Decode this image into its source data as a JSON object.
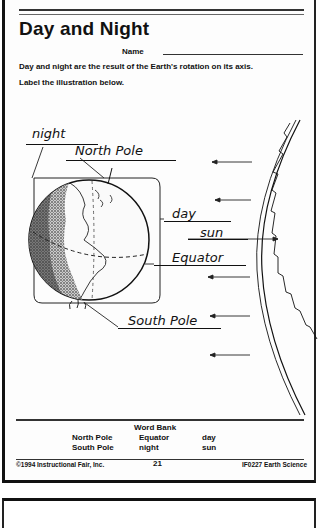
{
  "worksheet": {
    "title": "Day and Night",
    "name_label": "Name",
    "instructions": [
      "Day and night are the result of the Earth's rotation on its axis.",
      "Label the illustration below."
    ],
    "labels": {
      "night": "night",
      "north_pole": "North Pole",
      "day": "day",
      "sun": "sun",
      "equator": "Equator",
      "south_pole": "South Pole"
    },
    "word_bank": {
      "title": "Word Bank",
      "words": [
        "North Pole",
        "South Pole",
        "Equator",
        "night",
        "day",
        "sun"
      ]
    },
    "footer": {
      "copyright": "©1994 Instructional Fair, Inc.",
      "page_number": "21",
      "code": "IF0227 Earth Science"
    }
  },
  "icons": {
    "earth": "earth-globe-illustration",
    "sun": "sun-edge-illustration",
    "arrows": "sunlight-ray-arrows"
  }
}
